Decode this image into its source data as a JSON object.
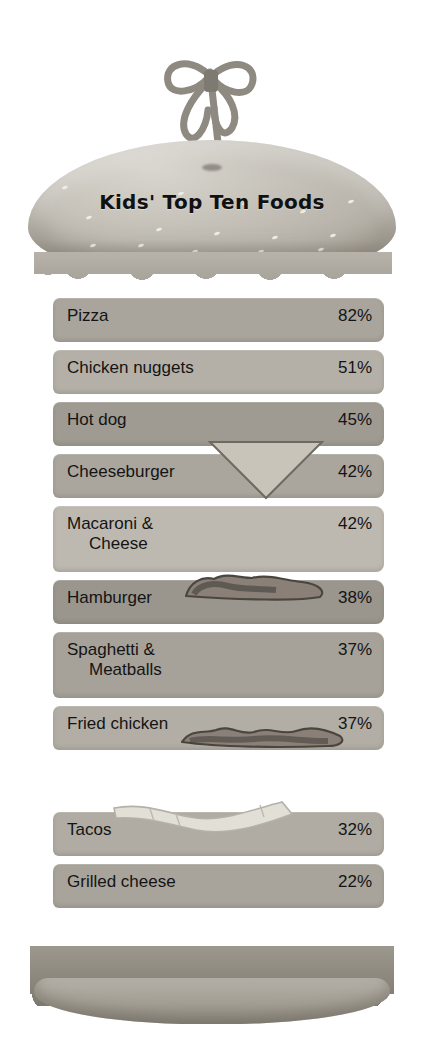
{
  "title": "Kids' Top Ten Foods",
  "decor": {
    "toothpick_bow": "ribbon-bow",
    "top_bun": "sesame-seed-bun-top",
    "bottom_bun": "bun-bottom",
    "lettuce_top": "lettuce-frill",
    "lettuce_bottom": "lettuce-frill",
    "cheese_slice": "cheese-slice-triangle",
    "bacon_strip_1": "bacon-strip",
    "bacon_strip_2": "bacon-strip",
    "onion_strip": "onion-slice"
  },
  "chart_data": {
    "type": "bar",
    "title": "Kids' Top Ten Foods",
    "xlabel": "",
    "ylabel": "",
    "unit": "%",
    "categories": [
      "Pizza",
      "Chicken nuggets",
      "Hot dog",
      "Cheeseburger",
      "Macaroni & Cheese",
      "Hamburger",
      "Spaghetti & Meatballs",
      "Fried chicken",
      "Tacos",
      "Grilled cheese"
    ],
    "values": [
      82,
      51,
      45,
      42,
      42,
      38,
      37,
      37,
      32,
      22
    ],
    "ylim": [
      0,
      100
    ],
    "grid": false,
    "legend": "none"
  },
  "rows": [
    {
      "label_line1": "Pizza",
      "label_line2": "",
      "value": "82%",
      "top": 298,
      "height": 44,
      "color": "#a9a59c"
    },
    {
      "label_line1": "Chicken nuggets",
      "label_line2": "",
      "value": "51%",
      "top": 350,
      "height": 44,
      "color": "#b4b0a7"
    },
    {
      "label_line1": "Hot dog",
      "label_line2": "",
      "value": "45%",
      "top": 402,
      "height": 44,
      "color": "#9f9b92"
    },
    {
      "label_line1": "Cheeseburger",
      "label_line2": "",
      "value": "42%",
      "top": 454,
      "height": 44,
      "color": "#aaa69d"
    },
    {
      "label_line1": "Macaroni &",
      "label_line2": "Cheese",
      "value": "42%",
      "top": 506,
      "height": 66,
      "color": "#bdb9b0"
    },
    {
      "label_line1": "Hamburger",
      "label_line2": "",
      "value": "38%",
      "top": 580,
      "height": 44,
      "color": "#9a968d"
    },
    {
      "label_line1": "Spaghetti &",
      "label_line2": "Meatballs",
      "value": "37%",
      "top": 632,
      "height": 66,
      "color": "#a6a299"
    },
    {
      "label_line1": "Fried chicken",
      "label_line2": "",
      "value": "37%",
      "top": 706,
      "height": 44,
      "color": "#b2aea5"
    },
    {
      "label_line1": "Tacos",
      "label_line2": "",
      "value": "32%",
      "top": 812,
      "height": 44,
      "color": "#b0aca3"
    },
    {
      "label_line1": "Grilled cheese",
      "label_line2": "",
      "value": "22%",
      "top": 864,
      "height": 44,
      "color": "#a8a49b"
    }
  ],
  "colors": {
    "background": "#ffffff",
    "text": "#141414",
    "bun": "#bdb9b0",
    "lettuce": "#97938a"
  }
}
